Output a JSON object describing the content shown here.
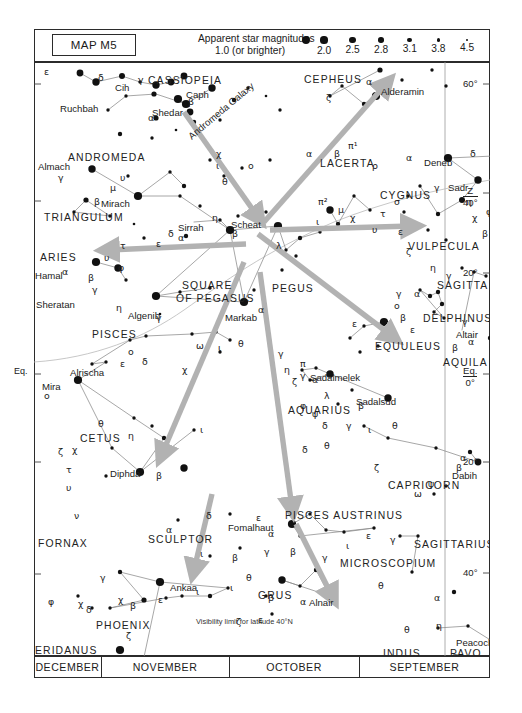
{
  "map": {
    "id_label": "MAP M5",
    "legend_title": "Apparent star magnitudes",
    "legend_sub": "1.0 (or brighter)",
    "magnitudes": [
      {
        "label": "2.0",
        "r": 3.6
      },
      {
        "label": "2.5",
        "r": 3.2
      },
      {
        "label": "2.8",
        "r": 2.8
      },
      {
        "label": "3.1",
        "r": 2.4
      },
      {
        "label": "3.8",
        "r": 1.8
      },
      {
        "label": "4.5",
        "r": 1.3
      }
    ],
    "brightest_r": 4.1,
    "visibility_note": "Visibility limit for latitude 40°N",
    "accent_arrow": "#b2b2b2",
    "star_color": "#111111",
    "line_color": "#8a8a8a",
    "frame_color": "#2b2b2b"
  },
  "months": [
    {
      "label": "DECEMBER",
      "left": 34,
      "width": 67
    },
    {
      "label": "NOVEMBER",
      "left": 101,
      "width": 128
    },
    {
      "label": "OCTOBER",
      "left": 229,
      "width": 130
    },
    {
      "label": "SEPTEMBER",
      "left": 359,
      "width": 131
    }
  ],
  "declinations": [
    {
      "label": "60°",
      "y": 84
    },
    {
      "label": "40°",
      "y": 193,
      "prefix": "Z"
    },
    {
      "label": "20°",
      "y": 273
    },
    {
      "label": "0°",
      "y": 374,
      "prefix": "Eq."
    },
    {
      "label": "20°",
      "y": 462
    },
    {
      "label": "40°",
      "y": 573
    }
  ],
  "left_equator_label": "Eq.",
  "constellations": [
    {
      "name": "CASSIOPEIA",
      "x": 148,
      "y": 75
    },
    {
      "name": "ANDROMEDA",
      "x": 68,
      "y": 152
    },
    {
      "name": "TRIANGULUM",
      "x": 44,
      "y": 212
    },
    {
      "name": "ARIES",
      "x": 40,
      "y": 252
    },
    {
      "name": "PISCES",
      "x": 92,
      "y": 329
    },
    {
      "name": "CETUS",
      "x": 80,
      "y": 433
    },
    {
      "name": "FORNAX",
      "x": 38,
      "y": 538
    },
    {
      "name": "SCULPTOR",
      "x": 148,
      "y": 534
    },
    {
      "name": "PHOENIX",
      "x": 96,
      "y": 620
    },
    {
      "name": "ERIDANUS",
      "x": 35,
      "y": 645
    },
    {
      "name": "CEPHEUS",
      "x": 304,
      "y": 74
    },
    {
      "name": "LACERTA",
      "x": 320,
      "y": 158
    },
    {
      "name": "CYGNUS",
      "x": 380,
      "y": 190
    },
    {
      "name": "VULPECULA",
      "x": 408,
      "y": 241
    },
    {
      "name": "SAGITTA",
      "x": 437,
      "y": 280
    },
    {
      "name": "DELPHINUS",
      "x": 423,
      "y": 313
    },
    {
      "name": "EQUULEUS",
      "x": 375,
      "y": 341
    },
    {
      "name": "AQUILA",
      "x": 443,
      "y": 357
    },
    {
      "name": "PEGUS",
      "x": 272,
      "y": 283
    },
    {
      "name": "SQUARE",
      "x": 182,
      "y": 280
    },
    {
      "name": "OF PEGASUS",
      "x": 176,
      "y": 293
    },
    {
      "name": "AQUARIUS",
      "x": 288,
      "y": 405
    },
    {
      "name": "CAPRICORN",
      "x": 388,
      "y": 480
    },
    {
      "name": "PISCES AUSTRINUS",
      "x": 285,
      "y": 510
    },
    {
      "name": "SAGITTARIUS",
      "x": 414,
      "y": 539
    },
    {
      "name": "MICROSCOPIUM",
      "x": 340,
      "y": 558
    },
    {
      "name": "GRUS",
      "x": 258,
      "y": 590
    },
    {
      "name": "INDUS",
      "x": 383,
      "y": 648
    },
    {
      "name": "PAVO",
      "x": 450,
      "y": 648
    }
  ],
  "named_stars": [
    {
      "name": "Ruchbah",
      "x": 60,
      "y": 103
    },
    {
      "name": "Shedar",
      "x": 152,
      "y": 107
    },
    {
      "name": "Caph",
      "x": 186,
      "y": 89
    },
    {
      "name": "Cih",
      "x": 115,
      "y": 82
    },
    {
      "name": "Almach",
      "x": 38,
      "y": 161
    },
    {
      "name": "Mirach",
      "x": 101,
      "y": 198
    },
    {
      "name": "Sirrah",
      "x": 178,
      "y": 222
    },
    {
      "name": "Scheat",
      "x": 231,
      "y": 219
    },
    {
      "name": "Hamal",
      "x": 35,
      "y": 270
    },
    {
      "name": "Sheratan",
      "x": 36,
      "y": 299
    },
    {
      "name": "Algenib",
      "x": 128,
      "y": 310
    },
    {
      "name": "Markab",
      "x": 225,
      "y": 312
    },
    {
      "name": "Alrischa",
      "x": 70,
      "y": 367
    },
    {
      "name": "Mira",
      "x": 42,
      "y": 381
    },
    {
      "name": "Diphda",
      "x": 110,
      "y": 468
    },
    {
      "name": "Andromeda Galaxy",
      "x": 186,
      "y": 133,
      "rot": -40
    },
    {
      "name": "Alderamin",
      "x": 381,
      "y": 86
    },
    {
      "name": "Deneb",
      "x": 424,
      "y": 157
    },
    {
      "name": "Sadr",
      "x": 448,
      "y": 182
    },
    {
      "name": "Altair",
      "x": 456,
      "y": 329
    },
    {
      "name": "Sadalmelek",
      "x": 310,
      "y": 372
    },
    {
      "name": "Sadalsud",
      "x": 356,
      "y": 396
    },
    {
      "name": "Dabih",
      "x": 452,
      "y": 470
    },
    {
      "name": "Ankaa",
      "x": 170,
      "y": 582
    },
    {
      "name": "Achernar",
      "x": 96,
      "y": 657
    },
    {
      "name": "Fomalhaut",
      "x": 228,
      "y": 522
    },
    {
      "name": "Alnair",
      "x": 309,
      "y": 597
    },
    {
      "name": "Peacock",
      "x": 456,
      "y": 637
    }
  ],
  "chart_data": {
    "type": "scatter",
    "xlabel": "Right ascension (months of visibility)",
    "ylabel": "Declination",
    "ylim": [
      -50,
      70
    ],
    "stars": [
      [
        46,
        73,
        2.0
      ],
      [
        62,
        82,
        1.2
      ],
      [
        88,
        76,
        2.4
      ],
      [
        106,
        82,
        3.2
      ],
      [
        122,
        85,
        1.4
      ],
      [
        137,
        82,
        2.0
      ],
      [
        150,
        76,
        1.6
      ],
      [
        144,
        99,
        1.0
      ],
      [
        152,
        104,
        0.9
      ],
      [
        178,
        88,
        1.1
      ],
      [
        156,
        112,
        2.0
      ],
      [
        120,
        94,
        2.8
      ],
      [
        92,
        96,
        3.2
      ],
      [
        74,
        110,
        3.4
      ],
      [
        200,
        100,
        3.0
      ],
      [
        214,
        88,
        3.4
      ],
      [
        232,
        96,
        3.6
      ],
      [
        246,
        110,
        3.2
      ],
      [
        122,
        118,
        2.6
      ],
      [
        160,
        122,
        3.0
      ],
      [
        186,
        120,
        3.3
      ],
      [
        86,
        134,
        3.0
      ],
      [
        118,
        138,
        3.4
      ],
      [
        142,
        130,
        3.6
      ],
      [
        58,
        169,
        1.1
      ],
      [
        94,
        176,
        3.2
      ],
      [
        104,
        196,
        1.0
      ],
      [
        136,
        172,
        3.2
      ],
      [
        150,
        186,
        3.1
      ],
      [
        146,
        196,
        3.3
      ],
      [
        176,
        160,
        3.4
      ],
      [
        190,
        176,
        3.2
      ],
      [
        208,
        168,
        3.4
      ],
      [
        236,
        160,
        3.3
      ],
      [
        52,
        200,
        2.6
      ],
      [
        40,
        212,
        3.2
      ],
      [
        76,
        216,
        3.3
      ],
      [
        100,
        224,
        3.6
      ],
      [
        166,
        206,
        3.2
      ],
      [
        186,
        220,
        3.4
      ],
      [
        196,
        230,
        1.0
      ],
      [
        204,
        216,
        3.2
      ],
      [
        152,
        236,
        3.0
      ],
      [
        110,
        238,
        3.2
      ],
      [
        62,
        262,
        1.0
      ],
      [
        84,
        268,
        1.4
      ],
      [
        92,
        280,
        3.4
      ],
      [
        122,
        296,
        1.0
      ],
      [
        146,
        292,
        3.2
      ],
      [
        176,
        288,
        3.4
      ],
      [
        126,
        314,
        3.5
      ],
      [
        244,
        226,
        1.0
      ],
      [
        232,
        212,
        3.4
      ],
      [
        252,
        250,
        3.2
      ],
      [
        266,
        238,
        3.1
      ],
      [
        210,
        302,
        1.0
      ],
      [
        220,
        290,
        3.3
      ],
      [
        296,
        210,
        1.4
      ],
      [
        304,
        224,
        3.0
      ],
      [
        320,
        196,
        3.2
      ],
      [
        336,
        210,
        3.2
      ],
      [
        286,
        232,
        3.4
      ],
      [
        262,
        256,
        3.2
      ],
      [
        248,
        270,
        3.3
      ],
      [
        342,
        96,
        1.0
      ],
      [
        330,
        104,
        3.0
      ],
      [
        308,
        86,
        3.2
      ],
      [
        296,
        96,
        3.4
      ],
      [
        346,
        70,
        2.8
      ],
      [
        368,
        80,
        3.3
      ],
      [
        398,
        70,
        3.2
      ],
      [
        412,
        86,
        3.4
      ],
      [
        414,
        158,
        1.0
      ],
      [
        444,
        180,
        1.1
      ],
      [
        428,
        200,
        2.2
      ],
      [
        404,
        214,
        3.0
      ],
      [
        386,
        186,
        3.2
      ],
      [
        374,
        196,
        3.3
      ],
      [
        370,
        212,
        3.4
      ],
      [
        394,
        230,
        3.2
      ],
      [
        412,
        240,
        3.2
      ],
      [
        460,
        156,
        2.4
      ],
      [
        470,
        186,
        3.0
      ],
      [
        466,
        204,
        3.2
      ],
      [
        480,
        212,
        3.4
      ],
      [
        470,
        234,
        3.1
      ],
      [
        428,
        268,
        3.2
      ],
      [
        440,
        272,
        3.2
      ],
      [
        452,
        276,
        3.3
      ],
      [
        386,
        290,
        3.2
      ],
      [
        396,
        296,
        3.0
      ],
      [
        404,
        292,
        3.1
      ],
      [
        408,
        304,
        3.0
      ],
      [
        400,
        312,
        3.2
      ],
      [
        410,
        318,
        3.4
      ],
      [
        462,
        324,
        0.8
      ],
      [
        456,
        338,
        3.0
      ],
      [
        468,
        330,
        3.2
      ],
      [
        350,
        322,
        1.0
      ],
      [
        330,
        326,
        3.4
      ],
      [
        316,
        338,
        3.3
      ],
      [
        344,
        346,
        3.2
      ],
      [
        326,
        352,
        3.3
      ],
      [
        44,
        380,
        1.0
      ],
      [
        72,
        362,
        3.2
      ],
      [
        58,
        364,
        3.4
      ],
      [
        96,
        340,
        3.4
      ],
      [
        112,
        336,
        3.3
      ],
      [
        158,
        334,
        3.3
      ],
      [
        182,
        332,
        3.4
      ],
      [
        196,
        340,
        3.2
      ],
      [
        186,
        352,
        3.3
      ],
      [
        100,
        418,
        3.2
      ],
      [
        118,
        426,
        3.2
      ],
      [
        130,
        438,
        3.1
      ],
      [
        78,
        448,
        3.4
      ],
      [
        106,
        472,
        1.0
      ],
      [
        150,
        468,
        1.2
      ],
      [
        160,
        430,
        3.2
      ],
      [
        72,
        476,
        3.4
      ],
      [
        296,
        374,
        1.1
      ],
      [
        282,
        368,
        3.2
      ],
      [
        268,
        370,
        3.3
      ],
      [
        276,
        380,
        3.4
      ],
      [
        354,
        398,
        1.2
      ],
      [
        318,
        390,
        3.3
      ],
      [
        304,
        404,
        3.4
      ],
      [
        330,
        426,
        3.3
      ],
      [
        354,
        438,
        3.2
      ],
      [
        402,
        448,
        3.2
      ],
      [
        444,
        462,
        1.6
      ],
      [
        436,
        452,
        3.0
      ],
      [
        464,
        466,
        3.2
      ],
      [
        412,
        486,
        3.2
      ],
      [
        400,
        494,
        3.4
      ],
      [
        258,
        524,
        1.0
      ],
      [
        276,
        514,
        3.2
      ],
      [
        292,
        530,
        3.3
      ],
      [
        310,
        532,
        3.2
      ],
      [
        340,
        528,
        3.3
      ],
      [
        266,
        536,
        3.2
      ],
      [
        248,
        580,
        1.4
      ],
      [
        266,
        586,
        3.2
      ],
      [
        282,
        570,
        3.1
      ],
      [
        296,
        596,
        1.0
      ],
      [
        232,
        596,
        3.2
      ],
      [
        238,
        614,
        3.2
      ],
      [
        366,
        536,
        3.2
      ],
      [
        384,
        536,
        3.2
      ],
      [
        378,
        572,
        3.3
      ],
      [
        420,
        592,
        3.0
      ],
      [
        404,
        628,
        3.2
      ],
      [
        434,
        626,
        3.2
      ],
      [
        466,
        646,
        1.0
      ],
      [
        126,
        582,
        1.0
      ],
      [
        86,
        572,
        3.0
      ],
      [
        110,
        600,
        2.8
      ],
      [
        76,
        608,
        3.2
      ],
      [
        132,
        598,
        3.3
      ],
      [
        148,
        596,
        3.2
      ],
      [
        176,
        596,
        3.1
      ],
      [
        194,
        588,
        3.2
      ],
      [
        44,
        596,
        3.4
      ],
      [
        58,
        608,
        3.4
      ],
      [
        86,
        650,
        1.0
      ],
      [
        144,
        520,
        3.2
      ],
      [
        196,
        514,
        3.4
      ],
      [
        206,
        548,
        3.3
      ],
      [
        176,
        556,
        3.2
      ]
    ]
  },
  "arrows": [
    {
      "from": [
        150,
        50
      ],
      "to": [
        224,
        155
      ],
      "name": "arrow-to-square-from-cassiopeia"
    },
    {
      "from": [
        230,
        160
      ],
      "to": [
        352,
        22
      ],
      "name": "arrow-to-alderamin"
    },
    {
      "from": [
        236,
        168
      ],
      "to": [
        378,
        164
      ],
      "name": "arrow-to-deneb"
    },
    {
      "from": [
        224,
        172
      ],
      "to": [
        358,
        274
      ],
      "name": "arrow-to-equuleus"
    },
    {
      "from": [
        212,
        182
      ],
      "to": [
        74,
        188
      ],
      "name": "arrow-to-aries"
    },
    {
      "from": [
        210,
        200
      ],
      "to": [
        128,
        392
      ],
      "name": "arrow-to-diphda"
    },
    {
      "from": [
        226,
        210
      ],
      "to": [
        258,
        446
      ],
      "name": "arrow-to-fomalhaut"
    },
    {
      "from": [
        262,
        462
      ],
      "to": [
        298,
        534
      ],
      "name": "arrow-to-alnair"
    },
    {
      "from": [
        178,
        432
      ],
      "to": [
        160,
        508
      ],
      "name": "arrow-to-ankaa"
    }
  ]
}
